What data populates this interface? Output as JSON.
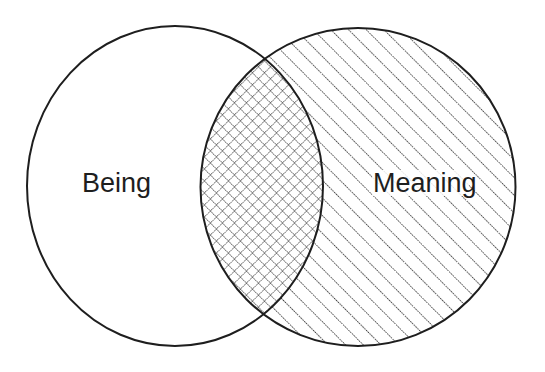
{
  "diagram": {
    "type": "venn",
    "sets": [
      {
        "label": "Being",
        "fill": "none"
      },
      {
        "label": "Meaning",
        "fill": "diagonal-hatch"
      }
    ],
    "intersection": {
      "fill": "cross-hatch"
    },
    "colors": {
      "stroke": "#1e1e1e",
      "background": "#ffffff"
    }
  }
}
